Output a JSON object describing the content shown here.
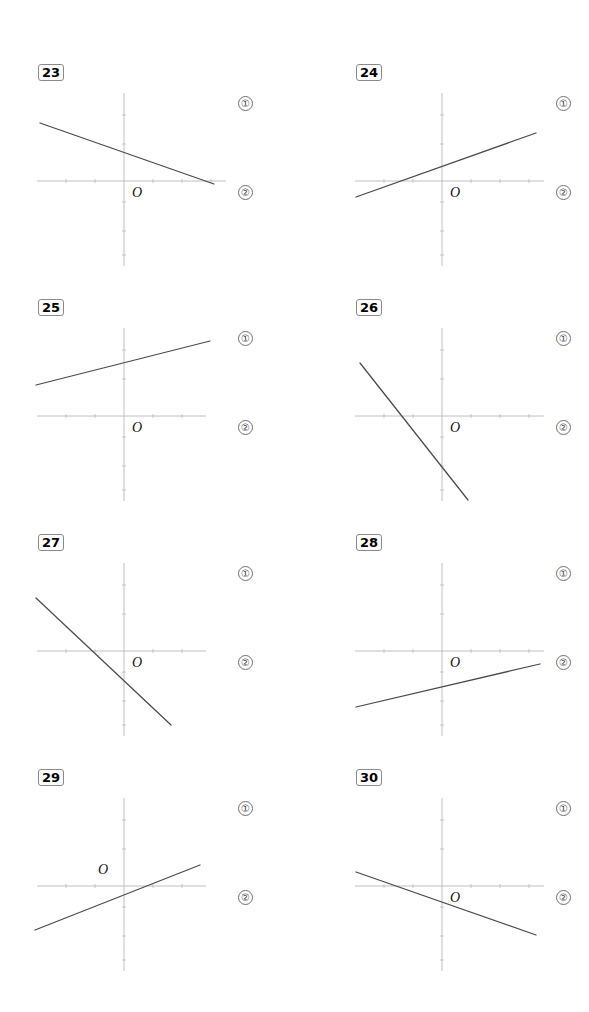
{
  "page": {
    "background": "#ffffff",
    "width": 589,
    "height": 1012,
    "axis_color": "#b9b9b9",
    "line_color": "#4a4a4a",
    "badge_border": "#8a8a8a"
  },
  "markers": {
    "option_one": "①",
    "option_two": "②"
  },
  "origin_symbol": "O",
  "problems": [
    {
      "number": "23",
      "origin_label": "O",
      "origin_label_pos": "below-right",
      "marker_one": "①",
      "marker_two": "②",
      "line": {
        "description": "gentle negative slope crossing y-axis above origin and x-axis to the right",
        "x1": 10,
        "y1": 63,
        "x2": 184,
        "y2": 124,
        "slope_sign": "negative",
        "y_intercept_sign": "positive"
      },
      "axes": {
        "x_axis": {
          "x1": 7,
          "y1": 121,
          "x2": 196,
          "y2": 121
        },
        "y_axis": {
          "x1": 94,
          "y1": 33,
          "x2": 94,
          "y2": 206
        },
        "ticks_x": [
          36,
          65,
          123,
          152,
          181
        ],
        "ticks_y": [
          55,
          84,
          142,
          171,
          195
        ]
      }
    },
    {
      "number": "24",
      "origin_label": "O",
      "origin_label_pos": "below-right",
      "marker_one": "①",
      "marker_two": "②",
      "line": {
        "description": "gentle positive slope crossing x-axis left of origin",
        "x1": 8,
        "y1": 137,
        "x2": 188,
        "y2": 73,
        "slope_sign": "positive",
        "y_intercept_sign": "positive"
      },
      "axes": {
        "x_axis": {
          "x1": 7,
          "y1": 121,
          "x2": 196,
          "y2": 121
        },
        "y_axis": {
          "x1": 94,
          "y1": 33,
          "x2": 94,
          "y2": 206
        },
        "ticks_x": [
          36,
          65,
          123,
          152,
          181
        ],
        "ticks_y": [
          55,
          84,
          142,
          171,
          195
        ]
      }
    },
    {
      "number": "25",
      "origin_label": "O",
      "origin_label_pos": "below-right",
      "marker_one": "①",
      "marker_two": "②",
      "line": {
        "description": "gentle positive slope entirely above the x-axis",
        "x1": 6,
        "y1": 90,
        "x2": 180,
        "y2": 46,
        "slope_sign": "positive",
        "y_intercept_sign": "positive"
      },
      "axes": {
        "x_axis": {
          "x1": 7,
          "y1": 121,
          "x2": 176,
          "y2": 121
        },
        "y_axis": {
          "x1": 94,
          "y1": 33,
          "x2": 94,
          "y2": 206
        },
        "ticks_x": [
          36,
          65,
          123,
          152
        ],
        "ticks_y": [
          55,
          84,
          142,
          171,
          195
        ]
      }
    },
    {
      "number": "26",
      "origin_label": "O",
      "origin_label_pos": "below-right",
      "marker_one": "①",
      "marker_two": "②",
      "line": {
        "description": "steep negative slope crossing y-axis below origin",
        "x1": 12,
        "y1": 68,
        "x2": 120,
        "y2": 205,
        "slope_sign": "negative",
        "y_intercept_sign": "negative"
      },
      "axes": {
        "x_axis": {
          "x1": 7,
          "y1": 121,
          "x2": 196,
          "y2": 121
        },
        "y_axis": {
          "x1": 94,
          "y1": 33,
          "x2": 94,
          "y2": 206
        },
        "ticks_x": [
          36,
          65,
          123,
          152,
          181
        ],
        "ticks_y": [
          55,
          84,
          142,
          171,
          195
        ]
      }
    },
    {
      "number": "27",
      "origin_label": "O",
      "origin_label_pos": "below-right",
      "marker_one": "①",
      "marker_two": "②",
      "line": {
        "description": "steep negative slope crossing y-axis below origin",
        "x1": 6,
        "y1": 68,
        "x2": 141,
        "y2": 195,
        "slope_sign": "negative",
        "y_intercept_sign": "negative"
      },
      "axes": {
        "x_axis": {
          "x1": 7,
          "y1": 121,
          "x2": 176,
          "y2": 121
        },
        "y_axis": {
          "x1": 94,
          "y1": 33,
          "x2": 94,
          "y2": 206
        },
        "ticks_x": [
          36,
          65,
          123,
          152
        ],
        "ticks_y": [
          55,
          84,
          142,
          171,
          195
        ]
      }
    },
    {
      "number": "28",
      "origin_label": "O",
      "origin_label_pos": "below-right",
      "marker_one": "①",
      "marker_two": "②",
      "line": {
        "description": "gentle positive slope lying entirely below the x-axis",
        "x1": 8,
        "y1": 177,
        "x2": 192,
        "y2": 134,
        "slope_sign": "positive",
        "y_intercept_sign": "negative"
      },
      "axes": {
        "x_axis": {
          "x1": 7,
          "y1": 121,
          "x2": 196,
          "y2": 121
        },
        "y_axis": {
          "x1": 94,
          "y1": 33,
          "x2": 94,
          "y2": 206
        },
        "ticks_x": [
          36,
          65,
          123,
          152,
          181
        ],
        "ticks_y": [
          55,
          84,
          142,
          171,
          195
        ]
      }
    },
    {
      "number": "29",
      "origin_label": "O",
      "origin_label_pos": "above-left",
      "marker_one": "①",
      "marker_two": "②",
      "line": {
        "description": "gentle positive slope through a point near the origin",
        "x1": 5,
        "y1": 165,
        "x2": 170,
        "y2": 100,
        "slope_sign": "positive",
        "y_intercept_sign": "negative"
      },
      "axes": {
        "x_axis": {
          "x1": 7,
          "y1": 121,
          "x2": 176,
          "y2": 121
        },
        "y_axis": {
          "x1": 94,
          "y1": 33,
          "x2": 94,
          "y2": 206
        },
        "ticks_x": [
          36,
          65,
          123,
          152
        ],
        "ticks_y": [
          55,
          84,
          142,
          171,
          195
        ]
      }
    },
    {
      "number": "30",
      "origin_label": "O",
      "origin_label_pos": "below-right",
      "marker_one": "①",
      "marker_two": "②",
      "line": {
        "description": "gentle negative slope crossing y-axis just below origin",
        "x1": 8,
        "y1": 107,
        "x2": 188,
        "y2": 170,
        "slope_sign": "negative",
        "y_intercept_sign": "negative"
      },
      "axes": {
        "x_axis": {
          "x1": 7,
          "y1": 121,
          "x2": 196,
          "y2": 121
        },
        "y_axis": {
          "x1": 94,
          "y1": 33,
          "x2": 94,
          "y2": 206
        },
        "ticks_x": [
          36,
          65,
          123,
          152,
          181
        ],
        "ticks_y": [
          55,
          84,
          142,
          171,
          195
        ]
      }
    }
  ]
}
